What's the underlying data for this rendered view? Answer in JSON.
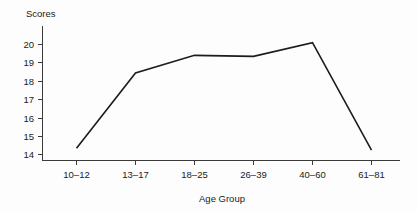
{
  "chart_data": {
    "type": "line",
    "title": "",
    "xlabel": "Age Group",
    "ylabel": "Scores",
    "categories": [
      "10–12",
      "13–17",
      "18–25",
      "26–39",
      "40–60",
      "61–81"
    ],
    "values": [
      14.2,
      18.05,
      18.95,
      18.9,
      19.6,
      14.1
    ],
    "series": [
      {
        "name": "Scores",
        "values": [
          14.2,
          18.05,
          18.95,
          18.9,
          19.6,
          14.1
        ]
      }
    ],
    "ylim": [
      13.55,
      20.45
    ],
    "yticks": [
      14,
      15,
      16,
      17,
      18,
      19,
      20
    ],
    "ytick_labels": [
      "14",
      "15",
      "16",
      "17",
      "18",
      "19",
      "20"
    ],
    "xtick_labels": [
      "10–12",
      "13–17",
      "18–25",
      "26–39",
      "40–60",
      "61–81"
    ],
    "grid": false,
    "legend": false,
    "legend_position": "none",
    "line_color": "#1c1c1c",
    "background_color": "#fdfdfd",
    "axis_color": "#3b3b3b",
    "ylabel_position": "top-left-horizontal"
  },
  "labels": {
    "y_axis_title": "Scores",
    "x_axis_title": "Age Group",
    "y_ticks": [
      "20",
      "19",
      "18",
      "17",
      "16",
      "15",
      "14"
    ],
    "x_ticks": [
      "10–12",
      "13–17",
      "18–25",
      "26–39",
      "40–60",
      "61–81"
    ]
  }
}
